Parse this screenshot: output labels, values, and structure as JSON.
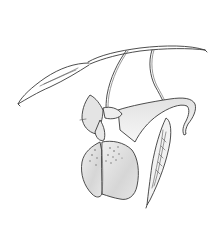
{
  "image": {
    "subject": "Botanical line drawing of a hanging flower with spur, stem, and seed pods",
    "alt": "Pencil illustration of a pendant flower on a curved stem with a slender seed pod at left and a ribbed seed pod at right",
    "colors": {
      "background": "#ffffff",
      "ink": "#3a3a3a",
      "petal_shade": "#d9d9d9",
      "petal_light": "#eeeeee",
      "speckle": "#6a6a6a"
    }
  }
}
